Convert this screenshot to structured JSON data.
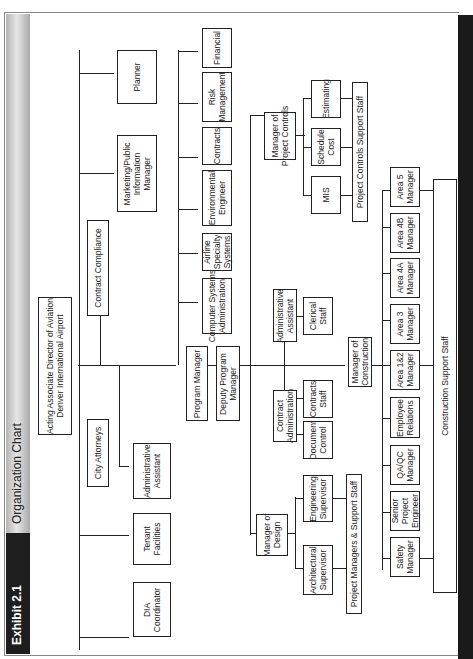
{
  "header": {
    "exhibit": "Exhibit 2.1",
    "title": "Organization Chart"
  },
  "chart": {
    "top": "Acting Associate Director of Aviation\nDenver International Airport",
    "staff": {
      "city_attorneys": "City Attorneys",
      "contract_compliance": "Contract Compliance",
      "admin_assistant": "Administrative\nAssistant",
      "tenant_facilities": "Tenant\nFacilities",
      "dia_coordinator": "DIA\nCoordinator",
      "marketing": "Marketing/Public\nInformation\nManager",
      "planner": "Planner"
    },
    "program_manager": "Program Manager",
    "program_units": [
      "Computer Systems\nAdministration",
      "Airline\nSpecialty\nSystems",
      "Environmental\nEngineer",
      "Contracts",
      "Risk\nManagement",
      "Financial"
    ],
    "deputy_program_manager": "Deputy Program\nManager",
    "admin_assistant_2": "Administrative\nAssistant",
    "clerical_staff": "Clerical\nStaff",
    "contract_administration": "Contract\nAdministration",
    "contracts_staff": "Contracts\nStaff",
    "document_control": "Document\nControl",
    "manager_of_design": "Manager of\nDesign",
    "engineering_supervisor": "Engineering\nSupervisor",
    "architectural_supervisor": "Architectural\nSupervisor",
    "project_managers_support": "Project Managers & Support Staff",
    "manager_of_construction": "Manager of\nConstruction",
    "construction_units": [
      "Safety\nManager",
      "Senior\nProject\nEngineer",
      "QA/QC\nManager",
      "Employee\nRelations",
      "Area 1&2\nManager",
      "Area 3\nManager",
      "Area 4A\nManager",
      "Area 4B\nManager",
      "Area 5\nManager"
    ],
    "construction_support": "Construction Support Staff",
    "manager_project_controls": "Manager of\nProject Controls",
    "project_controls_units": [
      "MIS",
      "Schedule\nCost",
      "Estimating"
    ],
    "project_controls_support": "Project Controls Support Staff"
  }
}
